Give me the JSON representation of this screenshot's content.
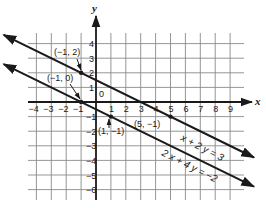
{
  "chart_data": {
    "type": "line",
    "title": "",
    "xlabel": "x",
    "ylabel": "y",
    "xlim": [
      -4.5,
      9.5
    ],
    "ylim": [
      -6.5,
      4.5
    ],
    "grid": true,
    "x_ticks": [
      -4,
      -3,
      -2,
      -1,
      1,
      2,
      3,
      4,
      5,
      6,
      7,
      8,
      9
    ],
    "y_ticks": [
      4,
      3,
      2,
      1,
      -1,
      -2,
      -3,
      -4,
      -5,
      -6
    ],
    "origin_label": "0",
    "series": [
      {
        "name": "x + 2y = 3",
        "equation": "x + 2 y = 3",
        "slope": -0.5,
        "intercept": 1.5,
        "x_range": [
          -6.2,
          10.6
        ],
        "points_labeled": [
          {
            "x": -1,
            "y": 2,
            "label": "(−1, 2)"
          },
          {
            "x": 5,
            "y": -1,
            "label": "(5, −1)"
          }
        ]
      },
      {
        "name": "2x + 4y = -2",
        "equation": "2 x + 4 y = −2",
        "slope": -0.5,
        "intercept": -0.5,
        "x_range": [
          -6.2,
          10.6
        ],
        "points_labeled": [
          {
            "x": -1,
            "y": 0,
            "label": "(−1, 0)"
          },
          {
            "x": 1,
            "y": -1,
            "label": "(1, −1)"
          }
        ]
      }
    ],
    "legend": "none (equations labeled inline along lines)"
  },
  "labels": {
    "x_axis": "x",
    "y_axis": "y",
    "origin": "0",
    "p1": "(−1, 2)",
    "p2": "(−1, 0)",
    "p3": "(1, −1)",
    "p4": "(5, −1)",
    "eq1": "x + 2 y = 3",
    "eq2": "2 x + 4 y = −2",
    "xt": [
      "−4",
      "−3",
      "−2",
      "−1",
      "1",
      "2",
      "3",
      "4",
      "5",
      "6",
      "7",
      "8",
      "9"
    ],
    "yt": [
      "4",
      "3",
      "2",
      "1",
      "−1",
      "−2",
      "−3",
      "−4",
      "−5",
      "−6"
    ]
  },
  "colors": {
    "ink": "#1a1a1a",
    "grid": "#8a8a8a",
    "background": "#ffffff"
  }
}
